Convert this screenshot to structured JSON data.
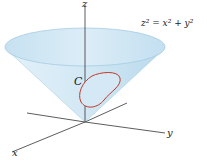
{
  "figure": {
    "equation": "z² = x² + y²",
    "curve_label": "C",
    "axes": {
      "x": "x",
      "y": "y",
      "z": "z"
    },
    "colors": {
      "cone_fill": "#cfe6f3",
      "cone_rim": "#b8d9ec",
      "curve": "#c0392b",
      "axis": "#333333"
    }
  }
}
